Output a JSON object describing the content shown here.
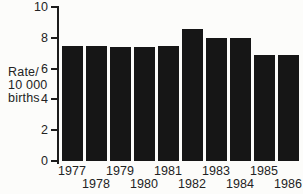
{
  "figure": {
    "background_color": "#fcfcfa",
    "bar_color": "#161616",
    "axis_color": "#1c1c1c",
    "text_color": "#232323"
  },
  "chart_data": {
    "type": "bar",
    "title": "",
    "xlabel": "",
    "ylabel": "Rate/10 000 births",
    "ylabel_lines": [
      "Rate/",
      "10 000",
      "births"
    ],
    "categories": [
      "1977",
      "1978",
      "1979",
      "1980",
      "1981",
      "1982",
      "1983",
      "1984",
      "1985",
      "1986"
    ],
    "values": [
      7.5,
      7.5,
      7.4,
      7.4,
      7.5,
      8.6,
      8.0,
      8.0,
      6.9,
      6.9
    ],
    "ylim": [
      0,
      10
    ],
    "yticks": [
      "0",
      "2",
      "4",
      "6",
      "8",
      "10"
    ],
    "grid": false,
    "legend": "none",
    "xtick_layout": "staggered"
  }
}
